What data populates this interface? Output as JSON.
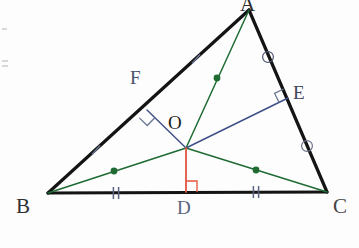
{
  "figure": {
    "width": 359,
    "height": 248,
    "background": "#fdfdfd"
  },
  "colors": {
    "triangle_stroke": "#141414",
    "green": "#1f6b33",
    "blue": "#3d4f86",
    "red": "#e2553c",
    "mark_blue": "#6b7694",
    "mark_dark": "#1a1a1a",
    "label_dark": "#2b2b2b",
    "label_blue": "#49506a"
  },
  "points": {
    "A": {
      "label": "A",
      "x": 249,
      "y": 10
    },
    "B": {
      "label": "B",
      "x": 48,
      "y": 193
    },
    "C": {
      "label": "C",
      "x": 327,
      "y": 192
    },
    "D": {
      "label": "D",
      "x": 186,
      "y": 192
    },
    "E": {
      "label": "E",
      "x": 288,
      "y": 98
    },
    "F": {
      "label": "F",
      "x": 147,
      "y": 110
    },
    "O": {
      "label": "O",
      "x": 186,
      "y": 148
    }
  },
  "segments": [
    {
      "name": "side-AB",
      "from": "A",
      "to": "B",
      "color": "#141414",
      "width": 3.2
    },
    {
      "name": "side-AC",
      "from": "A",
      "to": "C",
      "color": "#141414",
      "width": 3.2
    },
    {
      "name": "side-BC",
      "from": "B",
      "to": "C",
      "color": "#141414",
      "width": 3.2
    },
    {
      "name": "radius-OA",
      "from": "O",
      "to": "A",
      "color": "#1f6b33",
      "width": 1.5
    },
    {
      "name": "radius-OB",
      "from": "O",
      "to": "B",
      "color": "#1f6b33",
      "width": 1.5
    },
    {
      "name": "radius-OC",
      "from": "O",
      "to": "C",
      "color": "#1f6b33",
      "width": 1.5
    },
    {
      "name": "perpendicular-OF",
      "from": "O",
      "to": "F",
      "color": "#3d4f86",
      "width": 1.4
    },
    {
      "name": "perpendicular-OE",
      "from": "O",
      "to": "E",
      "color": "#3d4f86",
      "width": 1.4
    },
    {
      "name": "perpendicular-OD",
      "from": "O",
      "to": "D",
      "color": "#e2553c",
      "width": 1.8
    }
  ],
  "midpoint_dots": [
    {
      "name": "midpoint-dot-OA",
      "x": 217,
      "y": 78,
      "r": 3.4,
      "color": "#1f6b33"
    },
    {
      "name": "midpoint-dot-OB",
      "x": 114,
      "y": 171,
      "r": 3.4,
      "color": "#1f6b33"
    },
    {
      "name": "midpoint-dot-OC",
      "x": 256,
      "y": 170,
      "r": 3.4,
      "color": "#1f6b33"
    }
  ],
  "congruence_marks": [
    {
      "name": "tick-single-AF",
      "style": "single-tick",
      "x": 196,
      "y": 59,
      "angle": 42,
      "color": "#6b7694"
    },
    {
      "name": "tick-single-FB",
      "style": "single-tick",
      "x": 96,
      "y": 150,
      "angle": 42,
      "color": "#6b7694"
    },
    {
      "name": "tick-double-BD",
      "style": "double-tick",
      "x": 116,
      "y": 193,
      "angle": 0,
      "color": "#5a6480"
    },
    {
      "name": "tick-double-DC",
      "style": "double-tick",
      "x": 256,
      "y": 192,
      "angle": 0,
      "color": "#5a6480"
    },
    {
      "name": "mark-circle-AE",
      "style": "slashed-circle",
      "x": 268,
      "y": 57,
      "color": "#4d5570"
    },
    {
      "name": "mark-circle-EC",
      "style": "slashed-circle",
      "x": 307,
      "y": 146,
      "color": "#6a7289"
    }
  ],
  "right_angle_marks": [
    {
      "name": "right-angle-at-F",
      "x": 147,
      "y": 110,
      "color": "#6b7694",
      "size": 11
    },
    {
      "name": "right-angle-at-E",
      "x": 288,
      "y": 98,
      "color": "#6b7694",
      "size": 10
    },
    {
      "name": "right-angle-at-D",
      "x": 186,
      "y": 192,
      "color": "#e2553c",
      "size": 11
    }
  ]
}
